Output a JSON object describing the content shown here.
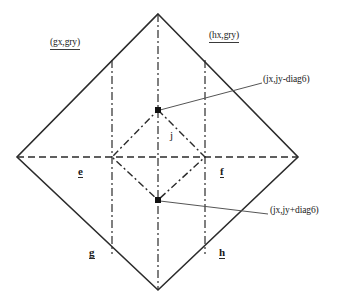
{
  "figure": {
    "canvas": {
      "width": 351,
      "height": 302
    },
    "stroke_color": "#2b2b2b",
    "background": "#ffffff"
  },
  "labels": {
    "top_left_coord": "(gx,gry)",
    "top_right_coord": "(hx,gry)",
    "upper_annotation": "(jx,jy-diag6)",
    "lower_annotation": "(jx,jy+diag6)",
    "node_e": "e",
    "node_f": "f",
    "node_g": "g",
    "node_h": "h",
    "node_j": "j"
  },
  "geometry": {
    "outer_diamond": {
      "style": "solid",
      "top": [
        158,
        14
      ],
      "left": [
        17,
        157
      ],
      "right": [
        298,
        157
      ],
      "bottom": [
        158,
        290
      ]
    },
    "inner_diamond": {
      "style": "dash-dot",
      "top": [
        158,
        110
      ],
      "left": [
        112,
        157
      ],
      "right": [
        205,
        157
      ],
      "bottom": [
        158,
        200
      ]
    },
    "vertical_guides": [
      112,
      158,
      205
    ],
    "horizontal_guide": 157,
    "marked_points": [
      {
        "name": "upper-vertex-marker",
        "x": 158,
        "y": 110
      },
      {
        "name": "lower-vertex-marker",
        "x": 158,
        "y": 200
      }
    ],
    "leader_lines": [
      {
        "name": "upper-leader",
        "from": [
          158,
          110
        ],
        "to": [
          262,
          83
        ]
      },
      {
        "name": "lower-leader",
        "from": [
          158,
          200
        ],
        "to": [
          268,
          214
        ]
      }
    ]
  }
}
